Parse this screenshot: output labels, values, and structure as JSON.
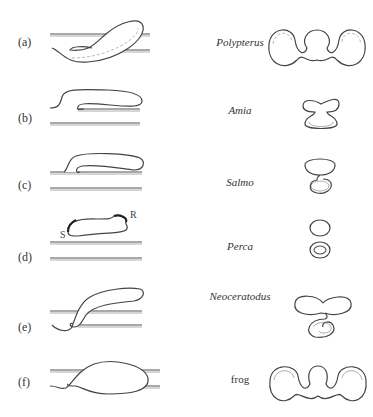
{
  "figure": {
    "panels": [
      {
        "label": "(a)",
        "species": "Polypterus",
        "italic": true
      },
      {
        "label": "(b)",
        "species": "Amia",
        "italic": true
      },
      {
        "label": "(c)",
        "species": "Salmo",
        "italic": true
      },
      {
        "label": "(d)",
        "species": "Perca",
        "italic": true,
        "annotations": [
          "S",
          "R"
        ]
      },
      {
        "label": "(e)",
        "species": "Neoceratodus",
        "italic": true
      },
      {
        "label": "(f)",
        "species": "frog",
        "italic": false
      }
    ]
  }
}
